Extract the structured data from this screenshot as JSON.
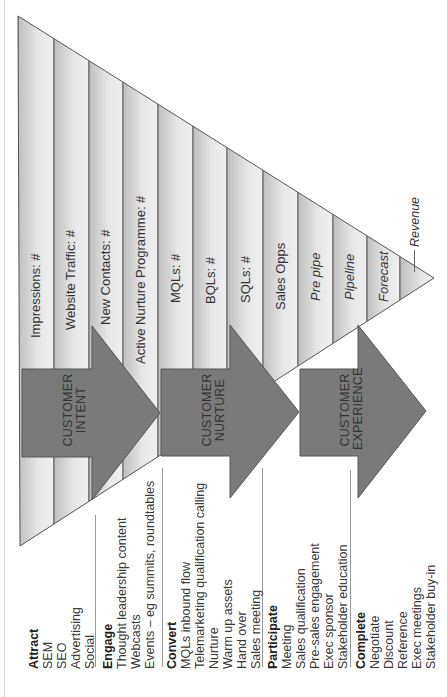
{
  "funnel": {
    "stages": [
      {
        "label": "Impressions: #",
        "italic": false
      },
      {
        "label": "Website Traffic: #",
        "italic": false
      },
      {
        "label": "New Contacts: #",
        "italic": false
      },
      {
        "label": "Active Nurture Programme: #",
        "italic": false
      },
      {
        "label": "MQLs: #",
        "italic": false
      },
      {
        "label": "BQLs: #",
        "italic": false
      },
      {
        "label": "SQLs: #",
        "italic": false
      },
      {
        "label": "Sales Opps",
        "italic": false
      },
      {
        "label": "Pre pipe",
        "italic": true
      },
      {
        "label": "Pipeline",
        "italic": true
      },
      {
        "label": "Forecast",
        "italic": true
      }
    ],
    "end_label": "Revenue"
  },
  "arrows": [
    {
      "line1": "CUSTOMER",
      "line2": "INTENT"
    },
    {
      "line1": "CUSTOMER",
      "line2": "NURTURE"
    },
    {
      "line1": "CUSTOMER",
      "line2": "EXPERIENCE"
    }
  ],
  "groups": [
    {
      "title": "Attract",
      "items": [
        "SEM",
        "SEO",
        "Advertising",
        "Social"
      ]
    },
    {
      "title": "Engage",
      "items": [
        "Thought leadership content",
        "Webcasts",
        "Events – eg summits, roundtables"
      ]
    },
    {
      "title": "Convert",
      "items": [
        "MQLs  inbound flow",
        "Telemarketing qualification calling",
        "Nurture",
        "Warm up assets",
        "Hand over",
        "Sales meeting"
      ]
    },
    {
      "title": "Participate",
      "items": [
        "Meeting",
        "Sales qualification",
        "Pre-sales engagement",
        "Exec sponsor",
        "Stakeholder education"
      ]
    },
    {
      "title": "Complete",
      "items": [
        "Negotiate",
        "Discount",
        "Reference",
        "Exec meetings",
        "Stakeholder buy-in"
      ]
    }
  ],
  "colors": {
    "arrow_fill": "#7a7a7a",
    "arrow_stroke": "#555555",
    "strip_dark": "#c4c4c4",
    "strip_light": "#ececec",
    "strip_border": "#555555"
  }
}
